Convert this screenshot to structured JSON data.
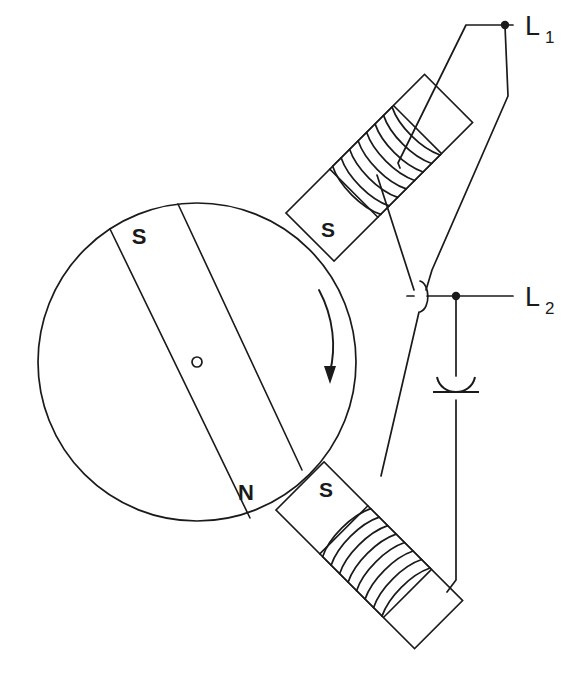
{
  "diagram": {
    "type": "electrical-schematic",
    "background_color": "#ffffff",
    "line_color": "#1a1a1a",
    "canvas": {
      "width": 587,
      "height": 693
    }
  },
  "rotor": {
    "name": "permanent-magnet-rotor",
    "center": {
      "x": 197,
      "y": 362
    },
    "radius": 159,
    "shaft_label": "o",
    "magnet_band": {
      "pole_upper_label": "S",
      "pole_lower_label": "N",
      "angle_deg": 75
    },
    "rotation": {
      "direction": "clockwise",
      "arrow_label": ""
    }
  },
  "stator_poles": [
    {
      "name": "upper-stator-pole",
      "label": "S",
      "angle_deg": -45,
      "coil_turns": 7,
      "position": "upper-right"
    },
    {
      "name": "lower-stator-pole",
      "label": "S",
      "angle_deg": 45,
      "coil_turns": 8,
      "position": "lower-right"
    }
  ],
  "terminals": [
    {
      "name": "terminal-l1",
      "label": "L",
      "subscript": "1",
      "x": 513,
      "y": 24
    },
    {
      "name": "terminal-l2",
      "label": "L",
      "subscript": "2",
      "x": 513,
      "y": 296
    }
  ],
  "capacitor": {
    "name": "run-capacitor",
    "type": "polarized",
    "label": "",
    "x": 456,
    "y": 394
  },
  "wire_hop": {
    "name": "wire-crossover-hop",
    "x": 418,
    "y": 296
  }
}
